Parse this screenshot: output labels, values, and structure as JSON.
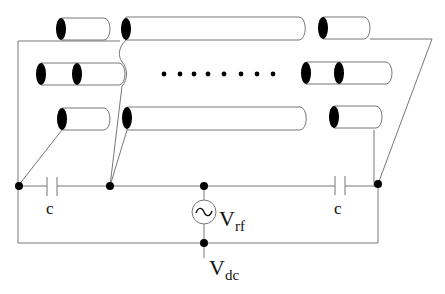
{
  "diagram": {
    "type": "circuit-schematic",
    "rows": [
      {
        "id": "row-1",
        "cylinders": 3
      },
      {
        "id": "row-2",
        "cylinders": 2,
        "ellipsis": "........"
      },
      {
        "id": "row-3",
        "cylinders": 3
      }
    ],
    "labels": {
      "capacitor_left": "c",
      "capacitor_right": "c",
      "rf_source_symbol": "~",
      "rf_label_main": "V",
      "rf_label_sub": "rf",
      "dc_label_main": "V",
      "dc_label_sub": "dc"
    },
    "colors": {
      "wire": "#777777",
      "cylinder_end": "#000000",
      "node": "#000000",
      "background": "#ffffff"
    }
  }
}
